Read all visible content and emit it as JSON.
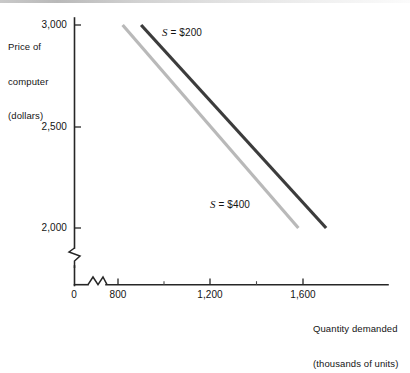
{
  "chart_data": {
    "type": "line",
    "title": "",
    "xlabel": "Quantity demanded (thousands of units)",
    "ylabel": "Price of computer (dollars)",
    "xlim": [
      0,
      1800
    ],
    "ylim": [
      2000,
      3000
    ],
    "grid": false,
    "legend_position": "inline-annotation",
    "x_ticks": [
      {
        "value": 0,
        "label": "0",
        "major": true
      },
      {
        "value": 800,
        "label": "800",
        "major": true
      },
      {
        "value": 1000,
        "label": "",
        "major": false
      },
      {
        "value": 1200,
        "label": "1,200",
        "major": true
      },
      {
        "value": 1400,
        "label": "",
        "major": false
      },
      {
        "value": 1600,
        "label": "1,600",
        "major": true
      }
    ],
    "y_ticks": [
      {
        "value": 2000,
        "label": "2,000",
        "major": true
      },
      {
        "value": 2500,
        "label": "2,500",
        "major": true
      },
      {
        "value": 3000,
        "label": "3,000",
        "major": true
      }
    ],
    "axis_breaks": {
      "x": true,
      "y": true
    },
    "series": [
      {
        "name": "S = $200",
        "label": "S = $200",
        "symbol": "S",
        "equals": "=",
        "value": "$200",
        "color": "#3c3c3c",
        "stroke_width": 3.2,
        "points": [
          {
            "x": 900,
            "y": 3000
          },
          {
            "x": 1700,
            "y": 2000
          }
        ]
      },
      {
        "name": "S = $400",
        "label": "S = $400",
        "symbol": "S",
        "equals": "=",
        "value": "$400",
        "color": "#b9b9b9",
        "stroke_width": 3.2,
        "points": [
          {
            "x": 820,
            "y": 3000
          },
          {
            "x": 1580,
            "y": 2000
          }
        ]
      }
    ]
  },
  "axis_titles": {
    "y_line1": "Price of",
    "y_line2": "computer",
    "y_line3": "(dollars)",
    "x_line1": "Quantity demanded",
    "x_line2": "(thousands of units)"
  },
  "tick_labels": {
    "y3000": "3,000",
    "y2500": "2,500",
    "y2000": "2,000",
    "x0": "0",
    "x800": "800",
    "x1200": "1,200",
    "x1600": "1,600"
  },
  "annotations": {
    "curve_dark_symbol": "S",
    "curve_dark_rest": " = $200",
    "curve_light_symbol": "S",
    "curve_light_rest": " = $400"
  },
  "colors": {
    "axis": "#262626",
    "curve_dark": "#3c3c3c",
    "curve_light": "#b9b9b9",
    "background": "#ffffff",
    "text": "#141414"
  }
}
